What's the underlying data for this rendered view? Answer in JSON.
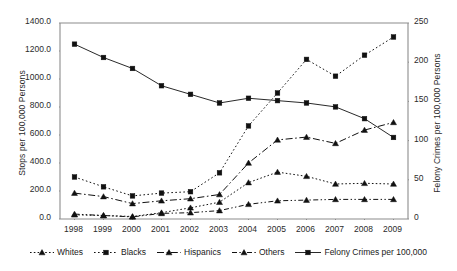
{
  "chart_data": {
    "type": "line",
    "title": "",
    "xlabel": "",
    "ylabel": "Stops per 100,000 Persons",
    "y2label": "Felony Crimes per 100,000 Persons",
    "grid": false,
    "legend_position": "bottom",
    "x": [
      1998,
      1999,
      2000,
      2001,
      2002,
      2003,
      2004,
      2005,
      2006,
      2007,
      2008,
      2009
    ],
    "categories": [
      "1998",
      "1999",
      "2000",
      "2001",
      "2002",
      "2003",
      "2004",
      "2005",
      "2006",
      "2007",
      "2008",
      "2009"
    ],
    "ylim": [
      0,
      1400
    ],
    "yticks": [
      0,
      200,
      400,
      600,
      800,
      1000,
      1200,
      1400
    ],
    "ytick_labels": [
      "0.0",
      "200.0",
      "400.0",
      "600.0",
      "800.0",
      "1000.0",
      "1200.0",
      "1400.0"
    ],
    "y2lim": [
      0,
      250
    ],
    "y2ticks": [
      0,
      50,
      100,
      150,
      200,
      250
    ],
    "y2tick_labels": [
      "0",
      "50",
      "100",
      "150",
      "200",
      "250"
    ],
    "series": [
      {
        "name": "Whites",
        "axis": "left",
        "marker": "triangle",
        "dash": "solid-dotted",
        "values": [
          30,
          25,
          18,
          45,
          80,
          120,
          260,
          335,
          305,
          250,
          255,
          250
        ]
      },
      {
        "name": "Blacks",
        "axis": "left",
        "marker": "square",
        "dash": "dotted",
        "values": [
          300,
          230,
          165,
          185,
          195,
          330,
          665,
          900,
          1140,
          1020,
          1170,
          1300
        ]
      },
      {
        "name": "Hispanics",
        "axis": "left",
        "marker": "triangle",
        "dash": "dash-dot",
        "values": [
          185,
          160,
          110,
          130,
          145,
          175,
          400,
          565,
          585,
          540,
          635,
          690
        ]
      },
      {
        "name": "Others",
        "axis": "left",
        "marker": "triangle",
        "dash": "dash-dot-dot",
        "values": [
          35,
          25,
          15,
          40,
          45,
          60,
          105,
          130,
          135,
          140,
          140,
          140
        ]
      },
      {
        "name": "Felony Crimes per 100,000",
        "axis": "right",
        "marker": "square",
        "dash": "solid",
        "values": [
          223,
          206,
          192,
          170,
          159,
          148,
          154,
          151,
          148,
          143,
          128,
          104
        ]
      }
    ]
  },
  "legend": {
    "items": [
      {
        "label": "Whites",
        "marker": "triangle",
        "dash": "solid-dotted"
      },
      {
        "label": "Blacks",
        "marker": "square",
        "dash": "dotted"
      },
      {
        "label": "Hispanics",
        "marker": "triangle",
        "dash": "dash-dot"
      },
      {
        "label": "Others",
        "marker": "triangle",
        "dash": "dash-dot-dot"
      },
      {
        "label": "Felony Crimes per 100,000",
        "marker": "square",
        "dash": "solid"
      }
    ]
  }
}
